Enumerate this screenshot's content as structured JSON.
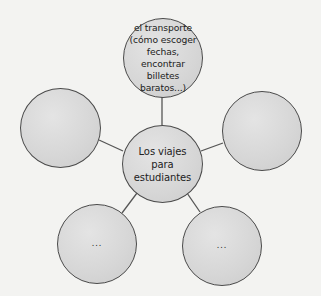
{
  "diagram": {
    "type": "mind-map",
    "colors": {
      "background": "#f3f3f1",
      "node_fill": "#d6d6d6",
      "node_border": "#4a4a4a",
      "connector": "#555555",
      "text": "#222222"
    },
    "center": {
      "label": "Los viajes\npara\nestudiantes"
    },
    "branches": [
      {
        "position": "top",
        "label": "el transporte\n(cómo escoger\nfechas, encontrar\nbilletes\nbaratos...)"
      },
      {
        "position": "left",
        "label": ""
      },
      {
        "position": "right",
        "label": ""
      },
      {
        "position": "bottom-left",
        "label": "..."
      },
      {
        "position": "bottom-right",
        "label": "..."
      }
    ]
  }
}
